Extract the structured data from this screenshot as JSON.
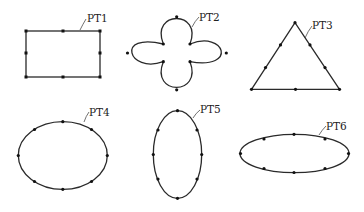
{
  "diagram": {
    "shapes": [
      {
        "id": "PT1",
        "label": "PT1",
        "type": "rectangle",
        "points": 8
      },
      {
        "id": "PT2",
        "label": "PT2",
        "type": "four-leaf",
        "points": 8
      },
      {
        "id": "PT3",
        "label": "PT3",
        "type": "triangle",
        "points": 9
      },
      {
        "id": "PT4",
        "label": "PT4",
        "type": "ellipse",
        "points": 8
      },
      {
        "id": "PT5",
        "label": "PT5",
        "type": "ellipse-vertical",
        "points": 8
      },
      {
        "id": "PT6",
        "label": "PT6",
        "type": "ellipse-horizontal",
        "points": 8
      }
    ]
  },
  "colors": {
    "stroke": "#2a2a2a",
    "dot": "#111111",
    "background": "#ffffff"
  }
}
